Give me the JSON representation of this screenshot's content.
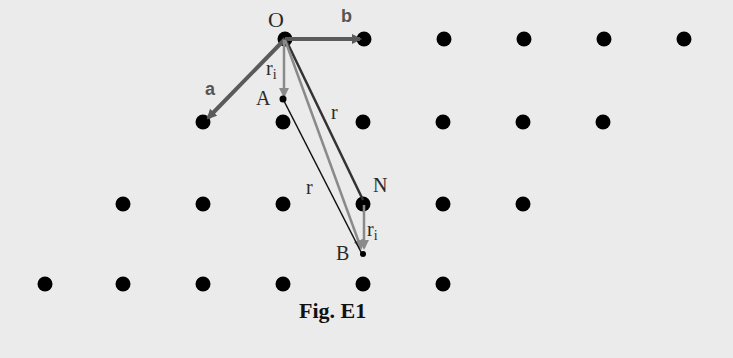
{
  "figure": {
    "caption": "Fig. E1",
    "labels": {
      "origin": "O",
      "vector_a": "a",
      "vector_b": "b",
      "point_A": "A",
      "point_N": "N",
      "point_B": "B",
      "r_upper": "r",
      "r_lower": "r",
      "ri_upper": "r",
      "ri_upper_sub": "i",
      "ri_lower": "r",
      "ri_lower_sub": "i"
    },
    "colors": {
      "background": "#ebebeb",
      "dot": "#000000",
      "basis_vector": "#5a5a5a",
      "r_vector": "#222222",
      "ri_vector": "#888888",
      "caption": "#111111"
    },
    "lattice_rows": [
      {
        "y": 39,
        "x": [
          285,
          364,
          444,
          524,
          604,
          684
        ]
      },
      {
        "y": 122,
        "x": [
          203,
          283,
          363,
          443,
          523,
          603
        ]
      },
      {
        "y": 204,
        "x": [
          123,
          203,
          283,
          363,
          443,
          523
        ]
      },
      {
        "y": 284,
        "x": [
          45,
          123,
          203,
          283,
          363,
          443
        ]
      }
    ]
  }
}
